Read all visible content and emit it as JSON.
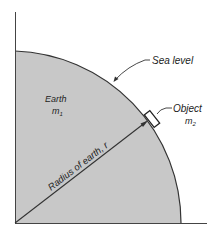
{
  "labels": {
    "sea_level": "Sea level",
    "earth": "Earth",
    "earth_mass_symbol": "m",
    "earth_mass_subscript": "1",
    "object": "Object",
    "object_mass_symbol": "m",
    "object_mass_subscript": "2",
    "radius": "Radius of earth, r"
  },
  "colors": {
    "earth_fill": "#c8c8c8",
    "line": "#333333",
    "background": "#ffffff"
  }
}
